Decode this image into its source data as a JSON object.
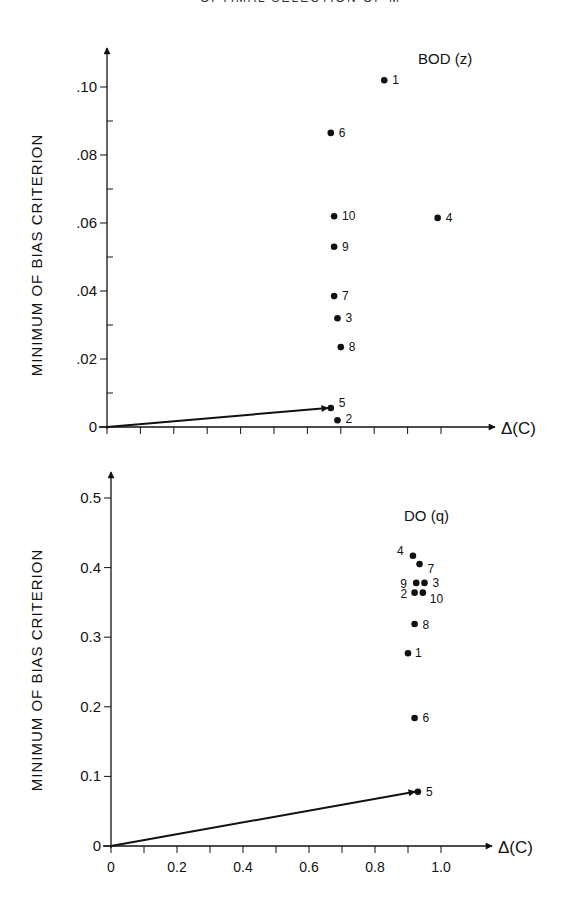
{
  "page": {
    "header_fragment": "OPTIMAL SELECTION OF MODELS"
  },
  "chart_data": [
    {
      "type": "scatter",
      "title": "BOD (z)",
      "xlabel": "Δ(C)",
      "ylabel": "MINIMUM OF BIAS CRITERION",
      "xlim": [
        0,
        1.0
      ],
      "ylim": [
        0,
        0.1
      ],
      "x_ticks": [
        0,
        0.1,
        0.2,
        0.3,
        0.4,
        0.5,
        0.6,
        0.7,
        0.8,
        0.9,
        1.0
      ],
      "x_tick_labels_shown": false,
      "y_ticks": [
        0,
        0.01,
        0.02,
        0.03,
        0.04,
        0.05,
        0.06,
        0.07,
        0.08,
        0.09,
        0.1
      ],
      "y_tick_labels": {
        "0": "0",
        "0.02": ".02",
        "0.04": ".04",
        "0.06": ".06",
        "0.08": ".08",
        "0.1": ".10"
      },
      "grid": false,
      "arrow_to_point": "5",
      "points": [
        {
          "label": "1",
          "x": 0.83,
          "y": 0.102
        },
        {
          "label": "2",
          "x": 0.69,
          "y": 0.002
        },
        {
          "label": "3",
          "x": 0.69,
          "y": 0.032
        },
        {
          "label": "4",
          "x": 0.99,
          "y": 0.0615
        },
        {
          "label": "5",
          "x": 0.67,
          "y": 0.0056
        },
        {
          "label": "6",
          "x": 0.67,
          "y": 0.0865
        },
        {
          "label": "7",
          "x": 0.68,
          "y": 0.0385
        },
        {
          "label": "8",
          "x": 0.7,
          "y": 0.0235
        },
        {
          "label": "9",
          "x": 0.68,
          "y": 0.053
        },
        {
          "label": "10",
          "x": 0.68,
          "y": 0.062
        }
      ]
    },
    {
      "type": "scatter",
      "title": "DO (q)",
      "xlabel": "Δ(C)",
      "ylabel": "MINIMUM OF BIAS CRITERION",
      "xlim": [
        0,
        1.0
      ],
      "ylim": [
        0,
        0.5
      ],
      "x_ticks": [
        0,
        0.1,
        0.2,
        0.3,
        0.4,
        0.5,
        0.6,
        0.7,
        0.8,
        0.9,
        1.0
      ],
      "x_tick_labels": {
        "0": "0",
        "0.2": "0.2",
        "0.4": "0.4",
        "0.6": "0.6",
        "0.8": "0.8",
        "1": "1.0"
      },
      "y_ticks": [
        0,
        0.1,
        0.2,
        0.3,
        0.4,
        0.5
      ],
      "y_tick_labels": {
        "0": "0",
        "0.1": "0.1",
        "0.2": "0.2",
        "0.3": "0.3",
        "0.4": "0.4",
        "0.5": "0.5"
      },
      "grid": false,
      "arrow_to_point": "5",
      "points": [
        {
          "label": "1",
          "x": 0.9,
          "y": 0.277
        },
        {
          "label": "2",
          "x": 0.92,
          "y": 0.364
        },
        {
          "label": "3",
          "x": 0.95,
          "y": 0.378
        },
        {
          "label": "4",
          "x": 0.915,
          "y": 0.417
        },
        {
          "label": "5",
          "x": 0.93,
          "y": 0.078
        },
        {
          "label": "6",
          "x": 0.92,
          "y": 0.184
        },
        {
          "label": "7",
          "x": 0.935,
          "y": 0.405
        },
        {
          "label": "8",
          "x": 0.92,
          "y": 0.319
        },
        {
          "label": "9",
          "x": 0.925,
          "y": 0.378
        },
        {
          "label": "10",
          "x": 0.945,
          "y": 0.364
        }
      ]
    }
  ]
}
